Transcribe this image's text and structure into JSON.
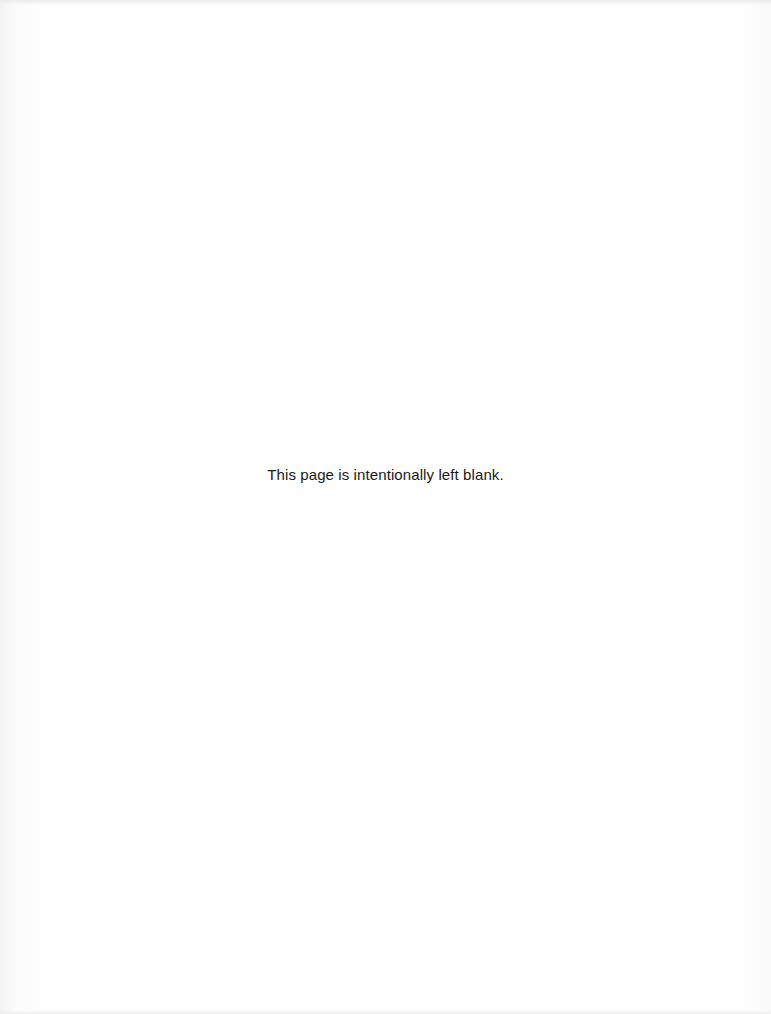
{
  "page": {
    "notice": "This page is intentionally left blank."
  }
}
